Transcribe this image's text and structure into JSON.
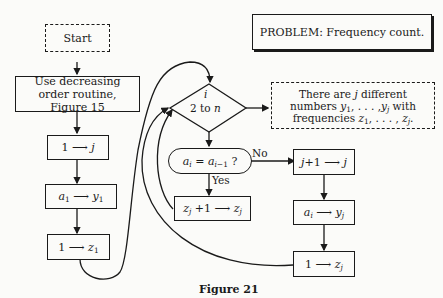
{
  "problem": {
    "label": "PROBLEM:",
    "text": "Frequency count."
  },
  "nodes": {
    "start": "Start",
    "sort": "Use decreasing order routine, Figure 15",
    "init_j": "1 → j",
    "init_y": "a1 → y1",
    "init_z": "1 → z1",
    "loop": {
      "var": "i",
      "range": "2 to n"
    },
    "decision": "ai = ai−1 ?",
    "increment_z": "zj + 1 → zj",
    "increment_j": "j + 1 → j",
    "assign_y": "ai → yj",
    "reset_z": "1 → zj",
    "output": "There are j different numbers y1, . . . , yj with frequencies z1, . . . , zj."
  },
  "edge_labels": {
    "no": "No",
    "yes": "Yes"
  },
  "caption": "Figure 21"
}
